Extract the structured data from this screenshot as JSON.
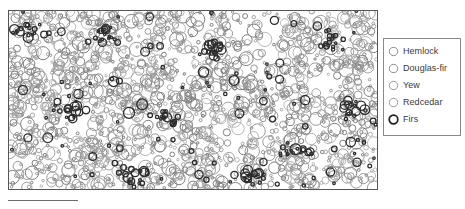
{
  "figure": {
    "background_color": "#ffffff",
    "frame_color": "#555555",
    "type": "spatial point pattern map"
  },
  "scale_bar": {
    "name": "scale-bar",
    "color": "#6b6b6b",
    "length_px": 70
  },
  "legend": {
    "name": "species-legend",
    "border_color": "#8a8a8a",
    "background": "#ffffff",
    "items": [
      {
        "label": "Hemlock",
        "marker": "open-circle-icon",
        "stroke": "#8e8e8e",
        "stroke_width": 1.0
      },
      {
        "label": "Douglas-fir",
        "marker": "open-circle-icon",
        "stroke": "#8e8e8e",
        "stroke_width": 1.0
      },
      {
        "label": "Yew",
        "marker": "open-circle-icon",
        "stroke": "#9a9a9a",
        "stroke_width": 1.0
      },
      {
        "label": "Redcedar",
        "marker": "open-circle-icon",
        "stroke": "#9a9a9a",
        "stroke_width": 1.0
      },
      {
        "label": "Firs",
        "marker": "open-circle-icon",
        "stroke": "#1f1f1f",
        "stroke_width": 1.7
      }
    ]
  },
  "chart_data": {
    "type": "scatter",
    "title": "",
    "subtitle": "",
    "xlabel": "",
    "ylabel": "",
    "xlim": [
      0,
      370
    ],
    "ylim": [
      0,
      180
    ],
    "grid": false,
    "legend_position": "right-outside",
    "marker_style": "open circle, radius proportional to tree size",
    "annotations": [
      "scale bar below lower-left of plot frame"
    ],
    "series": [
      {
        "name": "Hemlock",
        "color": "#8e8e8e",
        "stroke_width": 0.9,
        "count": 820
      },
      {
        "name": "Douglas-fir",
        "color": "#7d7d7d",
        "stroke_width": 1.0,
        "count": 410
      },
      {
        "name": "Yew",
        "color": "#a6a6a6",
        "stroke_width": 0.8,
        "count": 300
      },
      {
        "name": "Redcedar",
        "color": "#9a9a9a",
        "stroke_width": 0.9,
        "count": 220
      },
      {
        "name": "Firs",
        "color": "#2b2b2b",
        "stroke_width": 1.3,
        "count": 260
      }
    ],
    "point_radius_range": [
      1.2,
      7.5
    ],
    "total_points": 2010,
    "clearings": [
      {
        "cx": 0.2,
        "cy": 0.62,
        "rx": 0.075,
        "ry": 0.1
      },
      {
        "cx": 0.47,
        "cy": 0.3,
        "rx": 0.055,
        "ry": 0.09
      },
      {
        "cx": 0.62,
        "cy": 0.7,
        "rx": 0.06,
        "ry": 0.08
      },
      {
        "cx": 0.83,
        "cy": 0.4,
        "rx": 0.05,
        "ry": 0.09
      },
      {
        "cx": 0.35,
        "cy": 0.85,
        "rx": 0.055,
        "ry": 0.07
      },
      {
        "cx": 0.09,
        "cy": 0.3,
        "rx": 0.045,
        "ry": 0.07
      },
      {
        "cx": 0.72,
        "cy": 0.12,
        "rx": 0.05,
        "ry": 0.06
      }
    ],
    "clusters": [
      {
        "cx": 0.06,
        "cy": 0.13,
        "r": 0.05,
        "series": "Firs"
      },
      {
        "cx": 0.27,
        "cy": 0.14,
        "r": 0.04,
        "series": "Firs"
      },
      {
        "cx": 0.55,
        "cy": 0.22,
        "r": 0.04,
        "series": "Firs"
      },
      {
        "cx": 0.16,
        "cy": 0.55,
        "r": 0.05,
        "series": "Firs"
      },
      {
        "cx": 0.42,
        "cy": 0.6,
        "r": 0.04,
        "series": "Firs"
      },
      {
        "cx": 0.78,
        "cy": 0.78,
        "r": 0.05,
        "series": "Firs"
      },
      {
        "cx": 0.93,
        "cy": 0.55,
        "r": 0.04,
        "series": "Firs"
      },
      {
        "cx": 0.33,
        "cy": 0.92,
        "r": 0.05,
        "series": "Firs"
      },
      {
        "cx": 0.66,
        "cy": 0.93,
        "r": 0.04,
        "series": "Firs"
      },
      {
        "cx": 0.88,
        "cy": 0.18,
        "r": 0.04,
        "series": "Firs"
      }
    ]
  }
}
